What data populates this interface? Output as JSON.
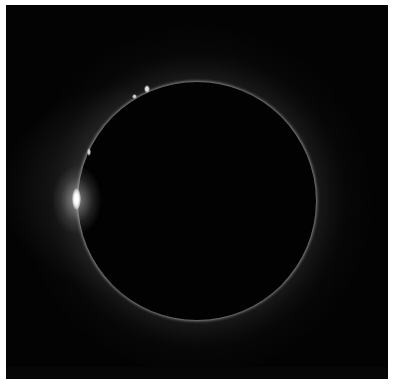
{
  "image": {
    "subject": "total solar eclipse with diamond ring effect",
    "colors": {
      "background": "#030303",
      "border": "#ffffff",
      "moon": "#020202",
      "corona": "#c8c8c8",
      "diamond_bead": "#ffffff"
    },
    "elements": [
      {
        "name": "moon-disk"
      },
      {
        "name": "corona-glow"
      },
      {
        "name": "diamond-ring-bead"
      },
      {
        "name": "prominences"
      }
    ]
  }
}
